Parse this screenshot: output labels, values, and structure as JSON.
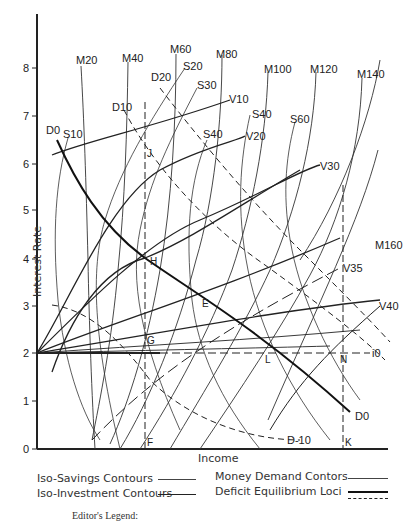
{
  "axes": {
    "x_label": "Income",
    "y_label": "Interest Rate",
    "y_ticks": [
      "0",
      "1",
      "2",
      "3",
      "4",
      "5",
      "6",
      "7",
      "8"
    ],
    "x_markers": [
      "F",
      "K"
    ]
  },
  "curve_labels": {
    "money_demand": [
      "M20",
      "M40",
      "M60",
      "M80",
      "M100",
      "M120",
      "M140",
      "M160"
    ],
    "savings": [
      "S10",
      "S20",
      "S30",
      "S40",
      "S40",
      "S60"
    ],
    "investment": [
      "V10",
      "V20",
      "V30",
      "V35",
      "V40"
    ],
    "deficit": [
      "D0",
      "D10",
      "D20",
      "D0",
      "D-10"
    ],
    "interest_line": "i0"
  },
  "points": [
    "J",
    "H",
    "E",
    "G",
    "L",
    "N",
    "F",
    "K"
  ],
  "legend": {
    "iso_savings": "Iso-Savings Contours",
    "iso_investment": "Iso-Investment Contours",
    "money_demand": "Money Demand Contors",
    "deficit_loci": "Deficit Equilibrium Loci",
    "editor": "Editor's Legend:"
  }
}
